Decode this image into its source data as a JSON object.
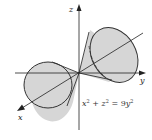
{
  "figure": {
    "equation": {
      "lhs_x": "x",
      "lhs_x_exp": "2",
      "plus": " + ",
      "lhs_z": "z",
      "lhs_z_exp": "2",
      "equals": " = ",
      "rhs_coef": "9",
      "rhs_y": "y",
      "rhs_y_exp": "2"
    },
    "axes": {
      "x_label": "x",
      "y_label": "y",
      "z_label": "z"
    },
    "colors": {
      "cone_fill": "#d6d6d6",
      "cone_stroke": "#333333",
      "axis": "#222222",
      "background": "#ffffff"
    }
  }
}
